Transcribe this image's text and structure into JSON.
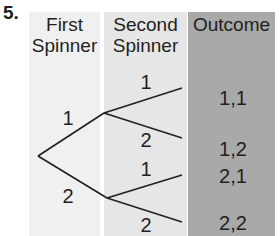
{
  "problem_number": "5.",
  "columns": [
    {
      "header_line1": "First",
      "header_line2": "Spinner"
    },
    {
      "header_line1": "Second",
      "header_line2": "Spinner"
    },
    {
      "header_line1": "Outcome",
      "header_line2": ""
    }
  ],
  "first_spinner": [
    "1",
    "2"
  ],
  "second_spinner": [
    "1",
    "2",
    "1",
    "2"
  ],
  "outcomes": [
    "1,1",
    "1,2",
    "2,1",
    "2,2"
  ],
  "colors": {
    "col1": "#f0f0f0",
    "col2": "#e6e6e6",
    "col3": "#a9a9a9",
    "line": "#231f20"
  }
}
